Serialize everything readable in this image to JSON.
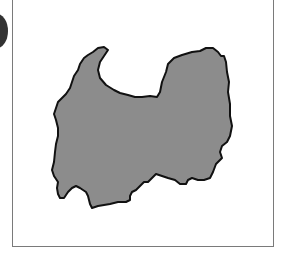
{
  "map": {
    "region_name": "",
    "fill_color": "#8c8c8c",
    "outline_color": "#111111",
    "frame_color": "#7a7a7a",
    "background_color": "#ffffff"
  },
  "shapes": [
    {
      "id": "region-outline",
      "points": "93,52 98,48 104,47 108,50 104,56 100,62 98,70 100,78 106,85 114,90 120,93 128,95 135,97 142,97 150,96 157,97 160,92 162,82 166,72 168,64 174,58 182,55 192,52 200,51 206,48 213,48 218,52 221,56 224,56 226,62 227,72 229,82 228,92 230,104 230,116 232,126 230,136 227,142 222,146 220,152 222,158 216,164 213,172 210,178 204,180 198,180 192,178 188,180 186,184 180,184 175,180 168,178 162,176 156,174 152,178 148,182 144,182 140,186 136,190 132,192 130,196 130,200 126,202 118,202 110,204 98,206 92,208 90,204 88,196 86,192 80,188 76,186 72,188 68,192 64,198 60,198 58,194 57,188 58,182 54,176 52,170 54,162 55,152 56,144 58,136 58,128 56,120 54,114 56,108 58,102 62,98 66,94 70,88 72,82 74,76 78,70 80,64 84,58 88,55"
    }
  ]
}
